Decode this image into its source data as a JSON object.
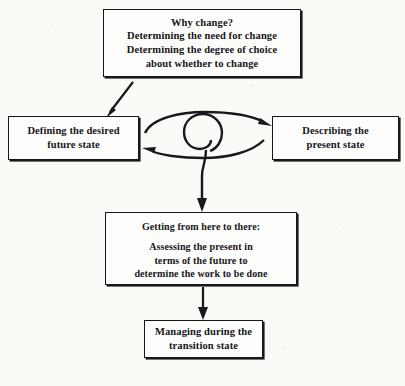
{
  "figure": {
    "type": "flow-diagram",
    "background_color": "#fbfaf7",
    "ink_color": "#1a181c",
    "nodes": [
      {
        "id": "why-change",
        "lines": [
          "Why change?",
          "Determining the need for change",
          "Determining the degree of choice",
          "about whether to change"
        ]
      },
      {
        "id": "future-state",
        "lines": [
          "Defining the desired",
          "future state"
        ]
      },
      {
        "id": "present-state",
        "lines": [
          "Describing the",
          "present state"
        ]
      },
      {
        "id": "getting-there",
        "heading": "Getting from here to there:",
        "lines": [
          "Assessing the present in",
          "terms of the future to",
          "determine the work to be done"
        ]
      },
      {
        "id": "transition-state",
        "lines": [
          "Managing during the",
          "transition state"
        ]
      }
    ],
    "connectors": [
      {
        "id": "why-to-future",
        "kind": "diagonal-arrow",
        "from": "why-change",
        "to": "future-state"
      },
      {
        "id": "future-to-present",
        "kind": "curved-arrow",
        "from": "future-state",
        "to": "present-state"
      },
      {
        "id": "present-to-future",
        "kind": "curved-arrow",
        "from": "present-state",
        "to": "future-state"
      },
      {
        "id": "spiral",
        "kind": "spiral-coil"
      },
      {
        "id": "spiral-to-getting-there",
        "kind": "vertical-arrow",
        "to": "getting-there"
      },
      {
        "id": "getting-there-to-transition",
        "kind": "vertical-arrow",
        "from": "getting-there",
        "to": "transition-state"
      }
    ]
  }
}
